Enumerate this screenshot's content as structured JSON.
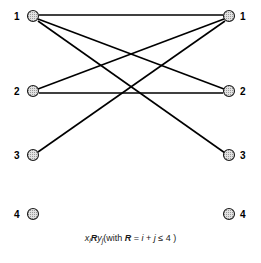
{
  "figure": {
    "type": "bipartite-relation-digraph",
    "width": 261,
    "height": 263,
    "background": "#ffffff",
    "edge_color": "#000000",
    "node_fill": "#d8d8d8",
    "node_stroke": "#1a1a1a"
  },
  "left_nodes": [
    {
      "label": "1",
      "index": 1,
      "cx": 33,
      "cy": 16,
      "r": 5.5,
      "label_x": 14,
      "label_y": 12
    },
    {
      "label": "2",
      "index": 2,
      "cx": 33,
      "cy": 91,
      "r": 5.5,
      "label_x": 14,
      "label_y": 87
    },
    {
      "label": "3",
      "index": 3,
      "cx": 33,
      "cy": 155,
      "r": 5.5,
      "label_x": 14,
      "label_y": 151
    },
    {
      "label": "4",
      "index": 4,
      "cx": 33,
      "cy": 214,
      "r": 5.5,
      "label_x": 14,
      "label_y": 210
    }
  ],
  "right_nodes": [
    {
      "label": "1",
      "index": 1,
      "cx": 229,
      "cy": 16,
      "r": 5.5,
      "label_x": 240,
      "label_y": 12
    },
    {
      "label": "2",
      "index": 2,
      "cx": 229,
      "cy": 91,
      "r": 5.5,
      "label_x": 240,
      "label_y": 87
    },
    {
      "label": "3",
      "index": 3,
      "cx": 229,
      "cy": 155,
      "r": 5.5,
      "label_x": 240,
      "label_y": 151
    },
    {
      "label": "4",
      "index": 4,
      "cx": 229,
      "cy": 214,
      "r": 5.5,
      "label_x": 240,
      "label_y": 210
    }
  ],
  "edges": [
    {
      "from": 1,
      "to": 1,
      "x1": 39,
      "y1": 15,
      "x2": 223,
      "y2": 15
    },
    {
      "from": 1,
      "to": 2,
      "x1": 38,
      "y1": 19,
      "x2": 224,
      "y2": 89
    },
    {
      "from": 1,
      "to": 3,
      "x1": 38,
      "y1": 21,
      "x2": 225,
      "y2": 153
    },
    {
      "from": 2,
      "to": 1,
      "x1": 38,
      "y1": 89,
      "x2": 224,
      "y2": 19
    },
    {
      "from": 2,
      "to": 2,
      "x1": 39,
      "y1": 93,
      "x2": 223,
      "y2": 93
    },
    {
      "from": 3,
      "to": 1,
      "x1": 38,
      "y1": 152,
      "x2": 225,
      "y2": 21
    }
  ],
  "caption": {
    "x_var": "x",
    "x_sub": "i",
    "relation_symbol": "R",
    "y_var": "y",
    "y_sub": "j",
    "open_paren": "(with ",
    "relation_name": "R",
    "equals": " = ",
    "condition_i": "i",
    "plus": " + ",
    "condition_j": "j",
    "leq": " ≤ ",
    "bound": "4",
    "close_paren": " )",
    "full_text": "xᵢ R yⱼ (with R = i + j ≤ 4 )"
  }
}
